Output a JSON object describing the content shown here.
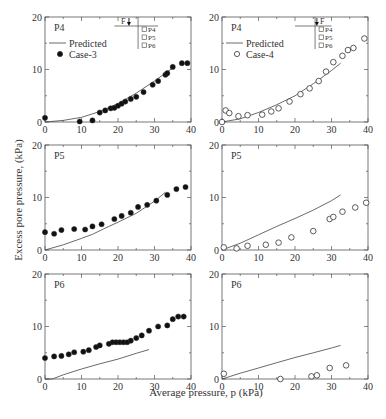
{
  "figure": {
    "ylabel": "Excess pore pressure, (kPa)",
    "xlabel": "Average pressure, p (kPa)"
  },
  "chart_data": [
    {
      "type": "scatter",
      "panel": "top-left",
      "label": "P4",
      "xlim": [
        0,
        40
      ],
      "ylim": [
        0,
        20
      ],
      "xticks": [
        0,
        10,
        20,
        30,
        40
      ],
      "yticks": [
        0,
        10,
        20
      ],
      "legend": {
        "placement": "top-left",
        "line_label": "Predicted",
        "marker_label": "Case-3",
        "marker": "filled-circle"
      },
      "inset": {
        "load_label": "F",
        "sensors": [
          "P4",
          "P5",
          "P6"
        ]
      },
      "series": [
        {
          "name": "Predicted",
          "kind": "line",
          "x": [
            0,
            5,
            10,
            15,
            20,
            25,
            30,
            35
          ],
          "y": [
            0,
            0.3,
            0.9,
            2.0,
            3.5,
            5.5,
            7.8,
            10.3
          ]
        },
        {
          "name": "Case-3",
          "kind": "filled-circle",
          "x": [
            0,
            9.5,
            13,
            15,
            16.5,
            18,
            19,
            20,
            21,
            22,
            23.5,
            25,
            27,
            29.5,
            31,
            33,
            33.5,
            35,
            37.5,
            39
          ],
          "y": [
            0.8,
            0.1,
            0.3,
            1.8,
            2.2,
            2.6,
            2.7,
            3.1,
            3.5,
            3.9,
            4.4,
            4.8,
            5.7,
            7.1,
            7.8,
            9.0,
            9.3,
            10.5,
            11.2,
            11.2
          ]
        }
      ]
    },
    {
      "type": "scatter",
      "panel": "top-right",
      "label": "P4",
      "xlim": [
        0,
        40
      ],
      "ylim": [
        0,
        20
      ],
      "xticks": [
        0,
        10,
        20,
        30,
        40
      ],
      "yticks": [
        0,
        10,
        20
      ],
      "legend": {
        "placement": "top-left",
        "line_label": "Predicted",
        "marker_label": "Case-4",
        "marker": "open-circle"
      },
      "inset": {
        "load_label": "F",
        "sensors": [
          "P4",
          "P5",
          "P6"
        ]
      },
      "series": [
        {
          "name": "Predicted",
          "kind": "line",
          "x": [
            0,
            5,
            10,
            15,
            20,
            25,
            30,
            32.5
          ],
          "y": [
            0,
            0.6,
            1.8,
            3.3,
            5.0,
            7.3,
            9.8,
            11.2
          ]
        },
        {
          "name": "Case-4",
          "kind": "open-circle",
          "x": [
            0,
            1,
            2,
            4.5,
            7,
            11,
            13.5,
            15.5,
            18.5,
            21.5,
            24,
            26.5,
            28.5,
            30.5,
            33,
            34.5,
            36,
            39
          ],
          "y": [
            0,
            2.2,
            1.7,
            1.1,
            1.3,
            1.4,
            2.0,
            2.6,
            3.9,
            5.3,
            6.4,
            7.8,
            9.6,
            11.4,
            12.6,
            13.7,
            14.1,
            15.9
          ]
        }
      ]
    },
    {
      "type": "scatter",
      "panel": "middle-left",
      "label": "P5",
      "xlim": [
        0,
        40
      ],
      "ylim": [
        0,
        20
      ],
      "xticks": [
        0,
        10,
        20,
        30,
        40
      ],
      "yticks": [
        0,
        10,
        20
      ],
      "series": [
        {
          "name": "Predicted",
          "kind": "line",
          "x": [
            0,
            5,
            10,
            13,
            16,
            20,
            25,
            30,
            33
          ],
          "y": [
            0,
            1.0,
            2.2,
            3.0,
            4.0,
            5.3,
            7.0,
            9.3,
            11.0
          ]
        },
        {
          "name": "Case-3",
          "kind": "filled-circle",
          "x": [
            0,
            2.5,
            4.5,
            8,
            11,
            13,
            15.5,
            19,
            21,
            23.5,
            25.5,
            28,
            30.5,
            33.5,
            36,
            38.5
          ],
          "y": [
            3.4,
            3.1,
            3.8,
            4.0,
            3.9,
            4.5,
            4.9,
            5.9,
            6.5,
            7.1,
            8.2,
            8.6,
            9.4,
            10.5,
            11.6,
            12.0
          ]
        }
      ]
    },
    {
      "type": "scatter",
      "panel": "middle-right",
      "label": "P5",
      "xlim": [
        0,
        40
      ],
      "ylim": [
        0,
        20
      ],
      "xticks": [
        0,
        10,
        20,
        30,
        40
      ],
      "yticks": [
        0,
        10,
        20
      ],
      "series": [
        {
          "name": "Predicted",
          "kind": "line",
          "x": [
            0,
            5,
            10,
            15,
            20,
            25,
            30,
            32.5
          ],
          "y": [
            0,
            1.3,
            2.9,
            4.5,
            6.0,
            7.6,
            9.4,
            10.5
          ]
        },
        {
          "name": "Case-4",
          "kind": "open-circle",
          "x": [
            0.5,
            4,
            7,
            12,
            15.5,
            19,
            25,
            29.5,
            30.5,
            33,
            36.5,
            39.5
          ],
          "y": [
            0.5,
            0.3,
            0.8,
            1.0,
            1.4,
            2.4,
            3.6,
            5.9,
            6.3,
            7.3,
            8.1,
            9.0
          ]
        }
      ]
    },
    {
      "type": "scatter",
      "panel": "bottom-left",
      "label": "P6",
      "xlim": [
        0,
        40
      ],
      "ylim": [
        0,
        20
      ],
      "xticks": [
        0,
        10,
        20,
        30,
        40
      ],
      "yticks": [
        0,
        10,
        20
      ],
      "series": [
        {
          "name": "Predicted",
          "kind": "line",
          "x": [
            0,
            2,
            5,
            10,
            15,
            20,
            25,
            28.5
          ],
          "y": [
            0,
            0,
            0.8,
            1.9,
            2.9,
            3.8,
            4.9,
            5.6
          ]
        },
        {
          "name": "Case-3",
          "kind": "filled-circle",
          "x": [
            0,
            2.5,
            4.5,
            6.5,
            8,
            10.5,
            12,
            14,
            15,
            17.5,
            18.5,
            19.5,
            20.5,
            21.5,
            22.5,
            23.5,
            25,
            26.5,
            28.5,
            31,
            33.5,
            35,
            36.5,
            38
          ],
          "y": [
            4.0,
            4.3,
            4.4,
            4.7,
            5.1,
            5.2,
            5.5,
            6.1,
            6.4,
            6.7,
            7.0,
            7.0,
            7.0,
            7.0,
            7.0,
            7.3,
            7.8,
            8.3,
            9.2,
            10.0,
            10.2,
            11.4,
            11.9,
            11.9
          ]
        }
      ]
    },
    {
      "type": "scatter",
      "panel": "bottom-right",
      "label": "P6",
      "xlim": [
        0,
        40
      ],
      "ylim": [
        0,
        20
      ],
      "xticks": [
        0,
        10,
        20,
        30,
        40
      ],
      "yticks": [
        0,
        10,
        20
      ],
      "series": [
        {
          "name": "Predicted",
          "kind": "line",
          "x": [
            0,
            5,
            10,
            15,
            20,
            25,
            30,
            32.5
          ],
          "y": [
            0,
            1.1,
            2.1,
            3.1,
            4.1,
            5.0,
            5.9,
            6.4
          ]
        },
        {
          "name": "Case-4",
          "kind": "open-circle",
          "x": [
            0.5,
            16,
            24.5,
            26,
            29.5,
            34
          ],
          "y": [
            1.0,
            0,
            0.5,
            0.7,
            2.1,
            2.6
          ]
        }
      ]
    }
  ]
}
